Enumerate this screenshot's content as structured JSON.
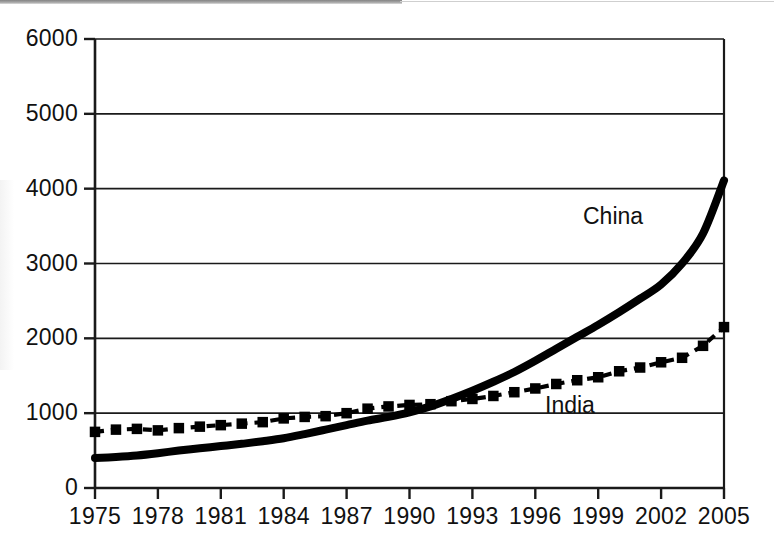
{
  "chart_data": {
    "type": "line",
    "title": "",
    "subtitle": "",
    "xlabel": "",
    "ylabel": "",
    "xlim": [
      1975,
      2005
    ],
    "ylim": [
      0,
      6000
    ],
    "grid": "horizontal",
    "legend_position": "inline-annotation",
    "x_ticklabels": [
      "1975",
      "1978",
      "1981",
      "1984",
      "1987",
      "1990",
      "1993",
      "1996",
      "1999",
      "2002",
      "2005"
    ],
    "x_tickvalues": [
      1975,
      1978,
      1981,
      1984,
      1987,
      1990,
      1993,
      1996,
      1999,
      2002,
      2005
    ],
    "y_ticklabels": [
      "0",
      "1000",
      "2000",
      "3000",
      "4000",
      "5000",
      "6000"
    ],
    "y_tickvalues": [
      0,
      1000,
      2000,
      3000,
      4000,
      5000,
      6000
    ],
    "x": [
      1975,
      1976,
      1977,
      1978,
      1979,
      1980,
      1981,
      1982,
      1983,
      1984,
      1985,
      1986,
      1987,
      1988,
      1989,
      1990,
      1991,
      1992,
      1993,
      1994,
      1995,
      1996,
      1997,
      1998,
      1999,
      2000,
      2001,
      2002,
      2003,
      2004,
      2005
    ],
    "series": [
      {
        "name": "China",
        "style": "solid-thick",
        "color": "#000000",
        "marker": "none",
        "label_text": "China",
        "values": [
          400,
          415,
          435,
          465,
          500,
          530,
          560,
          590,
          625,
          665,
          720,
          780,
          840,
          900,
          950,
          1010,
          1090,
          1190,
          1300,
          1420,
          1550,
          1700,
          1860,
          2020,
          2180,
          2350,
          2530,
          2720,
          3000,
          3400,
          4110
        ]
      },
      {
        "name": "India",
        "style": "dashed",
        "color": "#000000",
        "marker": "square",
        "label_text": "India",
        "values": [
          750,
          780,
          790,
          770,
          800,
          820,
          840,
          860,
          880,
          930,
          950,
          960,
          1000,
          1060,
          1090,
          1110,
          1120,
          1160,
          1190,
          1230,
          1280,
          1330,
          1390,
          1440,
          1480,
          1560,
          1610,
          1680,
          1740,
          1900,
          2150
        ]
      }
    ],
    "annotations": [
      {
        "text": "China",
        "x": 1998,
        "y": 3600
      },
      {
        "text": "India",
        "x": 1996,
        "y": 1050
      }
    ]
  },
  "axes": {
    "plot_left_px": 95,
    "plot_right_px": 724,
    "plot_top_px": 39,
    "plot_bottom_px": 488
  }
}
